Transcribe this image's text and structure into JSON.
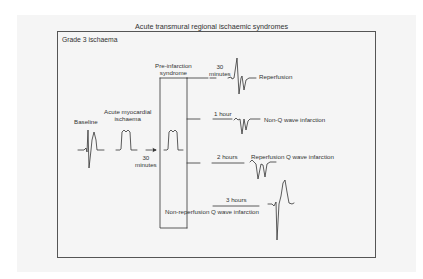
{
  "figure": {
    "title": "Acute transmural regional ischaemic syndromes",
    "panel_label": "Grade 3 ischaema"
  },
  "stages": {
    "baseline": "Baseline",
    "acute_ischaemia_line1": "Acute myocardial",
    "acute_ischaemia_line2": "ischaema",
    "transition_time_line1": "30",
    "transition_time_line2": "minutes",
    "pre_infarction_line1": "Pre-infarction",
    "pre_infarction_line2": "syndrome"
  },
  "outcomes": [
    {
      "time": "30 minutes",
      "time_line1": "30",
      "time_line2": "minutes",
      "label": "Reperfusion"
    },
    {
      "time": "1 hour",
      "label": "Non-Q wave infarction"
    },
    {
      "time": "2 hours",
      "label": "Reperfusion Q wave infarction"
    },
    {
      "time": "3 hours",
      "label": "Non-reperfusion Q wave infarction"
    }
  ]
}
